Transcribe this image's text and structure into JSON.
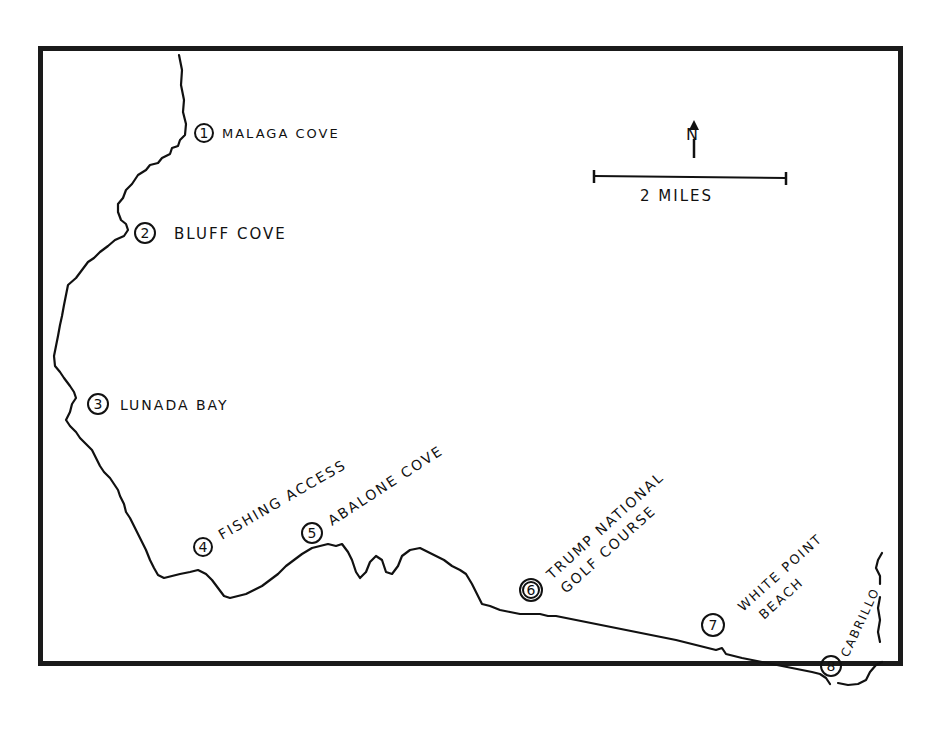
{
  "map": {
    "north_label": "N",
    "scale_label": "2 MILES",
    "scale_distance_miles": 2,
    "locations": [
      {
        "number": "1",
        "name": "MALAGA COVE"
      },
      {
        "number": "2",
        "name": "BLUFF COVE"
      },
      {
        "number": "3",
        "name": "LUNADA BAY"
      },
      {
        "number": "4",
        "name": "FISHING ACCESS"
      },
      {
        "number": "5",
        "name": "ABALONE COVE"
      },
      {
        "number": "6",
        "name_line1": "TRUMP NATIONAL",
        "name_line2": "GOLF COURSE"
      },
      {
        "number": "7",
        "name_line1": "WHITE POINT",
        "name_line2": "BEACH"
      },
      {
        "number": "8",
        "name": "CABRILLO"
      }
    ],
    "colors": {
      "ink": "#111111",
      "frame": "#1a1a1a",
      "paper": "#ffffff"
    }
  }
}
